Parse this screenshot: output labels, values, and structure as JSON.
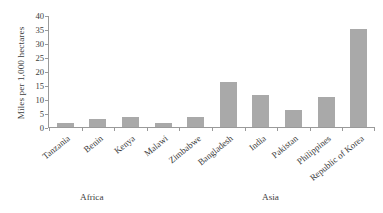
{
  "chart_data": {
    "type": "bar",
    "title": "",
    "xlabel": "",
    "ylabel": "Miles per 1,000 hectares",
    "ylim": [
      0,
      40
    ],
    "yticks": [
      0,
      5,
      10,
      15,
      20,
      25,
      30,
      35,
      40
    ],
    "grid": false,
    "legend": null,
    "bar_color": "#a9a9a9",
    "categories": [
      "Tanzania",
      "Benin",
      "Kenya",
      "Malawi",
      "Zimbabwe",
      "Bangladesh",
      "India",
      "Pakistan",
      "Philippines",
      "Republic of Korea"
    ],
    "values": [
      1.3,
      2.9,
      3.6,
      1.6,
      3.6,
      16.3,
      11.5,
      6.1,
      10.8,
      35.3
    ],
    "groups": [
      {
        "label": "Africa",
        "categories": [
          "Tanzania",
          "Benin",
          "Kenya",
          "Malawi",
          "Zimbabwe"
        ]
      },
      {
        "label": "Asia",
        "categories": [
          "Bangladesh",
          "India",
          "Pakistan",
          "Philippines",
          "Republic of Korea"
        ]
      }
    ]
  }
}
